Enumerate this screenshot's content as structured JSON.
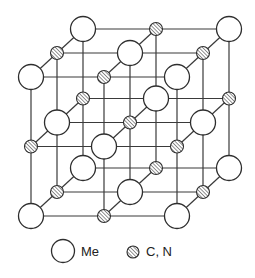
{
  "diagram": {
    "title": "",
    "lattice": {
      "size": [
        3,
        3,
        3
      ],
      "origin_back_top_left": [
        83,
        29
      ],
      "step_x": [
        73,
        0
      ],
      "step_y": [
        0,
        69.5
      ],
      "step_depth": [
        -26,
        24
      ],
      "rule": "site (i,j,k) is Me when (i+j+k) is even, else C/N; k=0 back plane, k=2 front plane"
    },
    "atoms": {
      "me": {
        "radius": 12.5,
        "fill": "#ffffff",
        "stroke": "#2e2e2e"
      },
      "cn": {
        "radius": 6.5,
        "fill": "hatched",
        "stroke": "#2e2e2e"
      }
    },
    "bond_color": "#3a3a3a"
  },
  "legend": {
    "items": [
      {
        "symbol": "large-open-circle",
        "label": "Me",
        "cx": 63,
        "cy": 251,
        "r": 11.5,
        "text_x": 81,
        "text_y": 256
      },
      {
        "symbol": "small-hatched-circle",
        "label": "C, N",
        "cx": 133,
        "cy": 252,
        "r": 6,
        "text_x": 146,
        "text_y": 256
      }
    ]
  }
}
